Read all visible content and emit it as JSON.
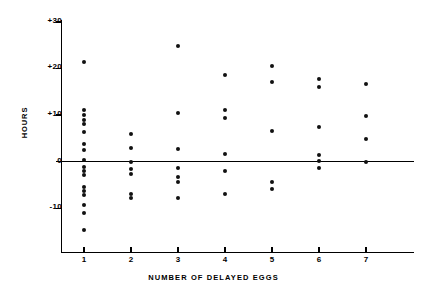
{
  "chart_data": {
    "type": "scatter",
    "title": "",
    "xlabel": "NUMBER OF DELAYED EGGS",
    "ylabel": "HOURS",
    "xlim": [
      0.5,
      7.7
    ],
    "ylim": [
      -16,
      31
    ],
    "grid": false,
    "legend": null,
    "xticks": [
      1,
      2,
      3,
      4,
      5,
      6,
      7
    ],
    "xtick_labels": [
      "1",
      "2",
      "3",
      "4",
      "5",
      "6",
      "7"
    ],
    "yticks": [
      30,
      20,
      10,
      0,
      -10
    ],
    "ytick_labels": [
      "+30",
      "+20",
      "+10",
      "0",
      "-10"
    ],
    "zero_line": 0,
    "marker": "filled-circle",
    "marker_color": "#111111",
    "points": [
      {
        "x": 1,
        "y": 21.3
      },
      {
        "x": 1,
        "y": 11.0
      },
      {
        "x": 1,
        "y": 10.0
      },
      {
        "x": 1,
        "y": 9.0
      },
      {
        "x": 1,
        "y": 8.0
      },
      {
        "x": 1,
        "y": 6.4
      },
      {
        "x": 1,
        "y": 3.8
      },
      {
        "x": 1,
        "y": 2.4
      },
      {
        "x": 1,
        "y": 0.3
      },
      {
        "x": 1,
        "y": -1.1
      },
      {
        "x": 1,
        "y": -2.1
      },
      {
        "x": 1,
        "y": -3.0
      },
      {
        "x": 1,
        "y": -5.4
      },
      {
        "x": 1,
        "y": -6.3
      },
      {
        "x": 1,
        "y": -7.2
      },
      {
        "x": 1,
        "y": -9.4
      },
      {
        "x": 1,
        "y": -11.1
      },
      {
        "x": 1,
        "y": -14.6
      },
      {
        "x": 2,
        "y": 6.0
      },
      {
        "x": 2,
        "y": 3.0
      },
      {
        "x": 2,
        "y": 0.0
      },
      {
        "x": 2,
        "y": -1.7
      },
      {
        "x": 2,
        "y": -2.7
      },
      {
        "x": 2,
        "y": -7.0
      },
      {
        "x": 2,
        "y": -7.9
      },
      {
        "x": 3,
        "y": 24.8
      },
      {
        "x": 3,
        "y": 10.5
      },
      {
        "x": 3,
        "y": 2.7
      },
      {
        "x": 3,
        "y": -1.3
      },
      {
        "x": 3,
        "y": -3.3
      },
      {
        "x": 3,
        "y": -4.3
      },
      {
        "x": 3,
        "y": -7.9
      },
      {
        "x": 4,
        "y": 18.5
      },
      {
        "x": 4,
        "y": 11.0
      },
      {
        "x": 4,
        "y": 9.3
      },
      {
        "x": 4,
        "y": 1.6
      },
      {
        "x": 4,
        "y": -2.1
      },
      {
        "x": 4,
        "y": -7.0
      },
      {
        "x": 5,
        "y": 20.5
      },
      {
        "x": 5,
        "y": 17.0
      },
      {
        "x": 5,
        "y": 6.5
      },
      {
        "x": 5,
        "y": -4.5
      },
      {
        "x": 5,
        "y": -5.9
      },
      {
        "x": 6,
        "y": 17.6
      },
      {
        "x": 6,
        "y": 15.9
      },
      {
        "x": 6,
        "y": 7.5
      },
      {
        "x": 6,
        "y": 1.4
      },
      {
        "x": 6,
        "y": 0.2
      },
      {
        "x": 6,
        "y": -1.3
      },
      {
        "x": 7,
        "y": 16.6
      },
      {
        "x": 7,
        "y": 9.8
      },
      {
        "x": 7,
        "y": 4.8
      },
      {
        "x": 7,
        "y": 0.0
      }
    ]
  }
}
